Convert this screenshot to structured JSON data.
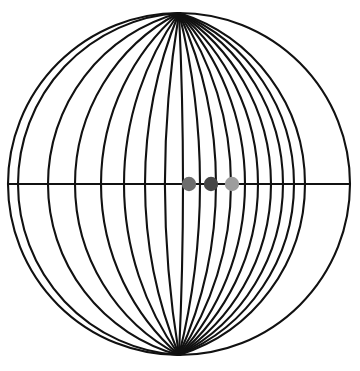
{
  "figure": {
    "type": "geometric-diagram",
    "background_color": "#ffffff",
    "canvas": {
      "width": 360,
      "height": 371
    }
  },
  "bounding_circle": {
    "name": "outer-circle",
    "center_x": 179,
    "center_y": 184,
    "radius": 171,
    "stroke_color": "#111111",
    "stroke_width": 2.1,
    "fill": "none"
  },
  "diameter_line": {
    "name": "horizontal-diameter",
    "x1": 8,
    "y1": 184,
    "x2": 350,
    "y2": 184,
    "stroke_color": "#111111",
    "stroke_width": 2.1
  },
  "arc_family": {
    "name": "coaxial-arcs",
    "count": 17,
    "stroke_color": "#111111",
    "stroke_width": 2.1,
    "fill": "none",
    "description": "Arcs sharing the top and bottom poles of the bounding circle, bulging progressively further to the left",
    "pole_top": {
      "x": 179,
      "y": 13
    },
    "pole_bottom": {
      "x": 179,
      "y": 355
    },
    "crossing_x": [
      18,
      48,
      75,
      101,
      124,
      145,
      165,
      183,
      200,
      216,
      231,
      245,
      258,
      271,
      283,
      294,
      305
    ]
  },
  "dots": [
    {
      "name": "dot-left",
      "cx": 189,
      "cy": 184,
      "r": 7.2,
      "color": "#6d6d6d"
    },
    {
      "name": "dot-middle",
      "cx": 211,
      "cy": 184,
      "r": 7.2,
      "color": "#474747"
    },
    {
      "name": "dot-right",
      "cx": 232,
      "cy": 184,
      "r": 7.2,
      "color": "#9d9d9d"
    }
  ],
  "chart_data": {
    "type": "scatter",
    "xlabel": "",
    "ylabel": "",
    "xlim": [
      8,
      350
    ],
    "ylim": [
      13,
      355
    ],
    "grid": false,
    "legend": "none",
    "series": [
      {
        "name": "marked-points",
        "x": [
          189,
          211,
          232
        ],
        "y": [
          184,
          184,
          184
        ],
        "colors": [
          "#6d6d6d",
          "#474747",
          "#9d9d9d"
        ]
      }
    ],
    "annotations": [
      "Outer circle centered at (179, 184) with radius 171",
      "Horizontal diameter drawn from (8, 184) to (350, 184)",
      "17 arcs of a coaxial pencil through the top and bottom poles",
      "Three filled gray dots lie on the diameter right of center"
    ]
  }
}
